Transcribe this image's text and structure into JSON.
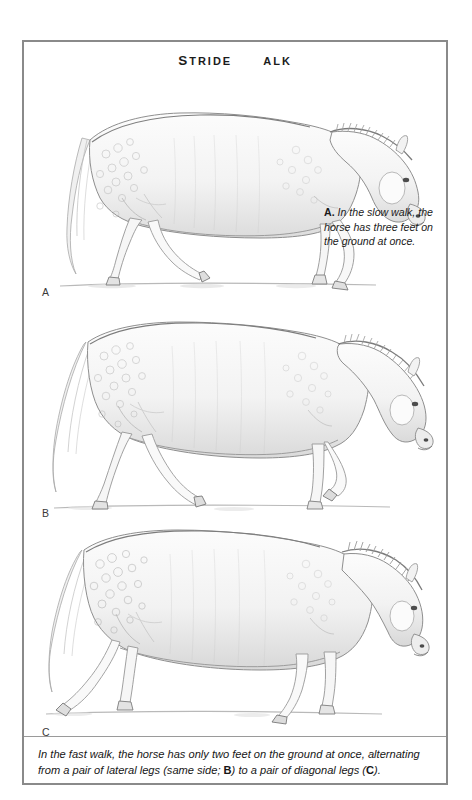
{
  "page": {
    "title_parts": [
      {
        "text": "S",
        "size": "cap"
      },
      {
        "text": "TRIDE",
        "size": "sc"
      },
      {
        "text": " ",
        "size": "sc"
      },
      {
        "text": "AT",
        "size": "sc"
      },
      {
        "text": " ",
        "size": "sc"
      },
      {
        "text": "THE",
        "size": "sc"
      },
      {
        "text": " ",
        "size": "sc"
      },
      {
        "text": "W",
        "size": "cap"
      },
      {
        "text": "ALK",
        "size": "sc"
      }
    ],
    "background_color": "#ffffff",
    "frame_color": "#8a8a8a",
    "ink_color": "#1a1a1a",
    "pencil_color": "#9a9a9a"
  },
  "panels": [
    {
      "id": "A",
      "label": "A",
      "subject": "dapple-grey horse at slow walk, three feet on ground",
      "caption": {
        "lead": "A.",
        "text": " In the slow walk, the horse has three feet on the ground at once."
      }
    },
    {
      "id": "B",
      "label": "B",
      "subject": "dapple-grey horse at fast walk, pair of lateral legs (same side) supporting"
    },
    {
      "id": "C",
      "label": "C",
      "subject": "dapple-grey horse at fast walk, pair of diagonal legs supporting"
    }
  ],
  "bottom_caption": {
    "segment_1": "In the fast walk, the horse has only two feet on the ground at once, alternating from a pair of lateral legs (same side; ",
    "bold_1": "B",
    "segment_2": ") to a pair of diagonal legs (",
    "bold_2": "C",
    "segment_3": ")."
  }
}
